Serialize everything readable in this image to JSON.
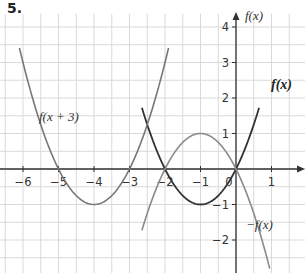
{
  "question_number": "5.",
  "colors": {
    "grid": "#d9d9d9",
    "axis": "#333333",
    "f": "#333333",
    "f_shift": "#777777",
    "neg_f": "#8a8a8a"
  },
  "chart_data": {
    "type": "line",
    "title": "5.",
    "xlabel": "",
    "ylabel": "f(x)",
    "xlim": [
      -6.5,
      1.9
    ],
    "ylim": [
      -2.9,
      4.4
    ],
    "grid": true,
    "x_ticks": [
      "−6",
      "−5",
      "−4",
      "−3",
      "−2",
      "−1",
      "0",
      "1"
    ],
    "y_ticks": [
      "4",
      "3",
      "2",
      "1",
      "−1",
      "−2"
    ],
    "series": [
      {
        "name": "f(x)",
        "formula": "x^2 + 2x",
        "vertex": [
          -1,
          -1
        ],
        "roots": [
          -2,
          0
        ],
        "x_range": [
          -2.65,
          0.65
        ]
      },
      {
        "name": "f(x + 3)",
        "formula": "(x+3)^2 + 2(x+3)",
        "vertex": [
          -4,
          -1
        ],
        "roots": [
          -5,
          -3
        ],
        "x_range": [
          -6.1,
          -1.9
        ]
      },
      {
        "name": "−f(x)",
        "formula": "-(x^2 + 2x)",
        "vertex": [
          -1,
          1
        ],
        "roots": [
          -2,
          0
        ],
        "x_range": [
          -2.65,
          0.95
        ]
      }
    ],
    "annotations": [
      {
        "text": "f(x + 3)",
        "x": -5.3,
        "y": 1.4
      },
      {
        "text": "f(x)",
        "x": 0.9,
        "y": 2.4
      },
      {
        "text": "−f(x)",
        "x": 0.35,
        "y": -1.6
      },
      {
        "text": "f(x)",
        "x": 0.15,
        "y": 4.2
      }
    ]
  },
  "labels": {
    "y_axis": "f(x)",
    "curve_f": "f(x)",
    "curve_shift": "f(x + 3)",
    "curve_neg": "−f(x)"
  }
}
